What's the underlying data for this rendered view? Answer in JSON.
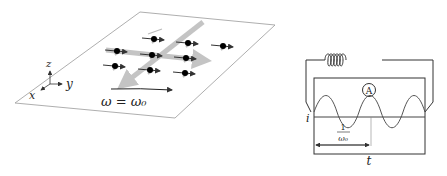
{
  "left_panel": {
    "axes": {
      "x": "x",
      "y": "y",
      "z": "z"
    },
    "rotation_label": "ω = ω₀",
    "spin_count": 9
  },
  "right_panel": {
    "ammeter_label": "A",
    "current_label": "i",
    "period_label_num": "1",
    "period_label_den": "ω₀",
    "time_label": "t"
  },
  "colors": {
    "line": "#333333",
    "thick_arrow": "#bbbbbb",
    "plane": "#999999"
  }
}
